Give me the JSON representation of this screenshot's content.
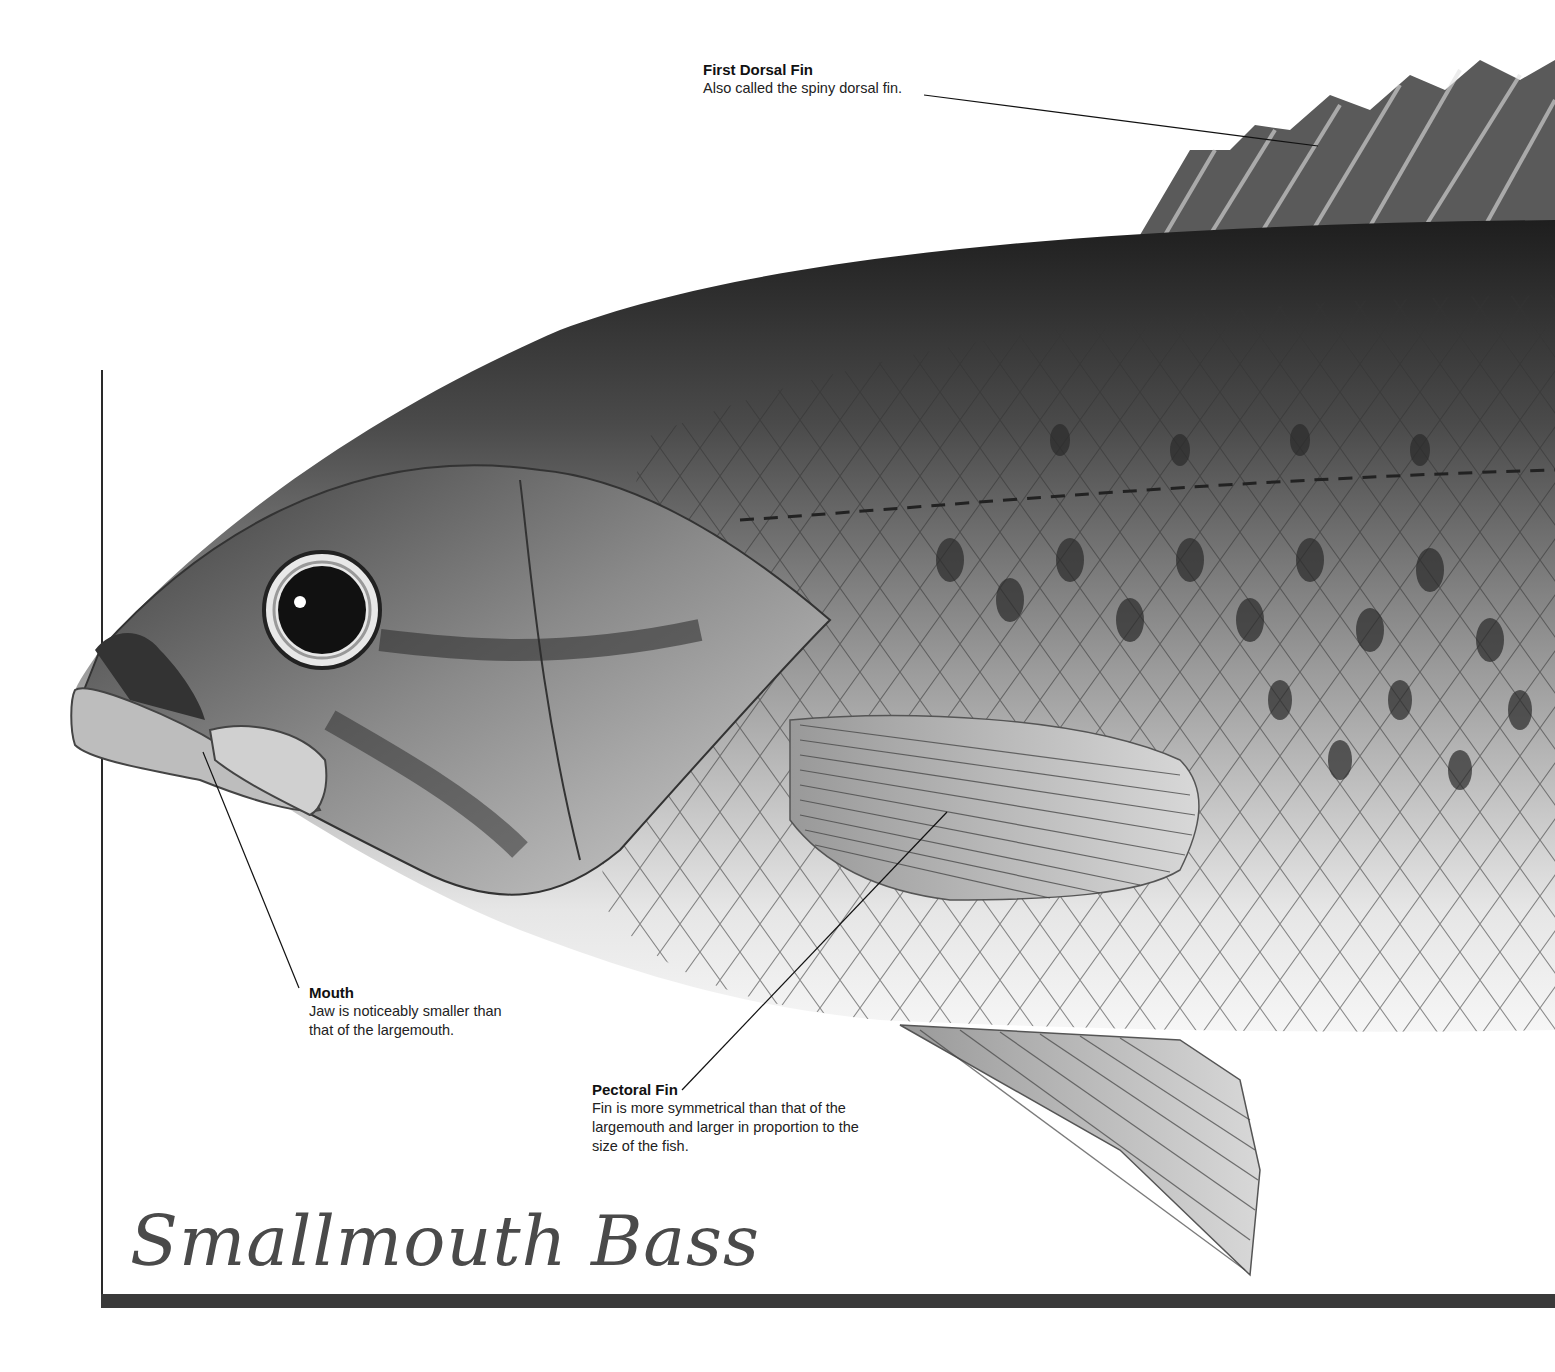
{
  "title": "Smallmouth Bass",
  "labels": {
    "dorsal": {
      "title": "First Dorsal Fin",
      "desc": "Also called the spiny dorsal fin."
    },
    "mouth": {
      "title": "Mouth",
      "desc_line1": "Jaw is noticeably smaller than",
      "desc_line2": "that of the largemouth."
    },
    "pectoral": {
      "title": "Pectoral Fin",
      "desc_line1": "Fin is more symmetrical than that of the",
      "desc_line2": "largemouth and larger in proportion to the",
      "desc_line3": "size of the fish."
    }
  },
  "colors": {
    "frame": "#2a2a2a",
    "title_text": "#4a4a4a",
    "body_dark": "#2e2e2e",
    "body_light": "#e8e8e8"
  }
}
